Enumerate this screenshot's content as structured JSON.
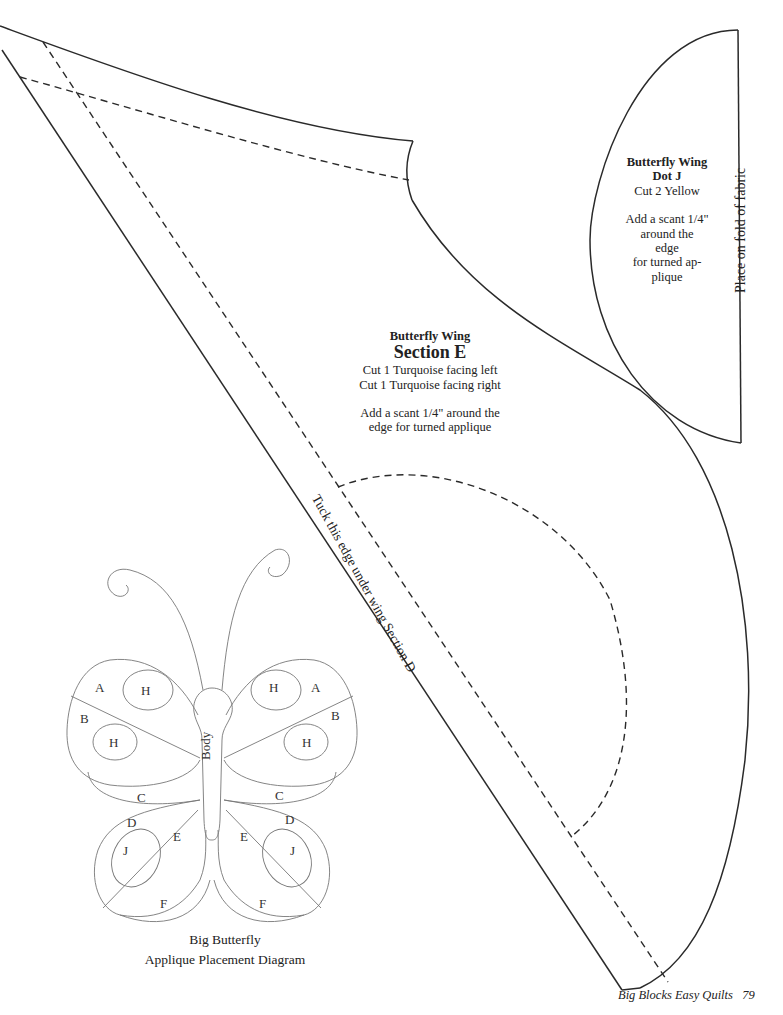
{
  "dot_j": {
    "title": "Butterfly Wing",
    "subtitle": "Dot J",
    "cut": "Cut 2 Yellow",
    "note_lines": [
      "Add a scant 1/4\"",
      "around the",
      "edge",
      "for turned ap-",
      "plique"
    ],
    "fold_label": "Place on fold of fabric"
  },
  "section_e": {
    "title": "Butterfly Wing",
    "subtitle": "Section E",
    "cut_lines": [
      "Cut 1 Turquoise facing left",
      "Cut 1 Turquoise facing right"
    ],
    "note_lines": [
      "Add a scant 1/4\" around the",
      "edge for turned applique"
    ],
    "tuck_label": "Tuck this edge under wing Section D"
  },
  "diagram": {
    "labels": {
      "a": "A",
      "b": "B",
      "c": "C",
      "d": "D",
      "e": "E",
      "f": "F",
      "h": "H",
      "j": "J",
      "body": "Body"
    },
    "caption_line1": "Big Butterfly",
    "caption_line2": "Applique Placement Diagram"
  },
  "footer": {
    "book_title": "Big Blocks Easy Quilts",
    "page_number": "79"
  }
}
